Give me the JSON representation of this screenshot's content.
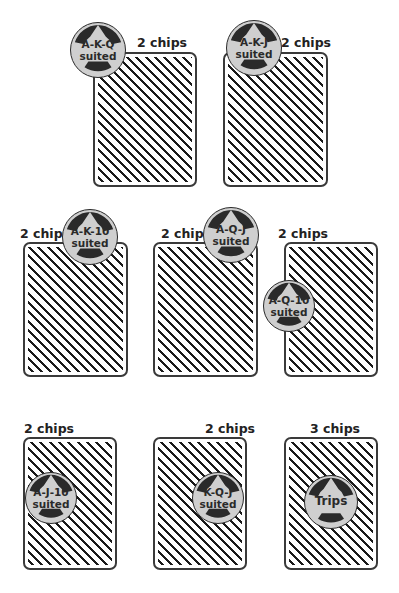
{
  "colors": {
    "card_border": "#3a3a3a",
    "pattern": "#1a1a1a",
    "chip_face": "#cfcfcf",
    "chip_ring": "#2a2a2a",
    "text": "#222222"
  },
  "bets": [
    {
      "id": "akq",
      "payout": "2 chips",
      "line1": "A-K-Q",
      "line2": "suited"
    },
    {
      "id": "akj",
      "payout": "2 chips",
      "line1": "A-K-J",
      "line2": "suited"
    },
    {
      "id": "ak10",
      "payout": "2 chips",
      "line1": "A-K-10",
      "line2": "suited"
    },
    {
      "id": "aqj",
      "payout": "2 chips",
      "line1": "A-Q-J",
      "line2": "suited"
    },
    {
      "id": "aq10",
      "payout": "2 chips",
      "line1": "A-Q-10",
      "line2": "suited"
    },
    {
      "id": "aj10",
      "payout": "2 chips",
      "line1": "A-J-10",
      "line2": "suited"
    },
    {
      "id": "kqj",
      "payout": "2 chips",
      "line1": "K-Q-J",
      "line2": "suited"
    },
    {
      "id": "trips",
      "payout": "3 chips",
      "line1": "Trips",
      "line2": ""
    }
  ],
  "icons": {
    "card": "card-back-icon",
    "chip": "poker-chip-icon"
  }
}
